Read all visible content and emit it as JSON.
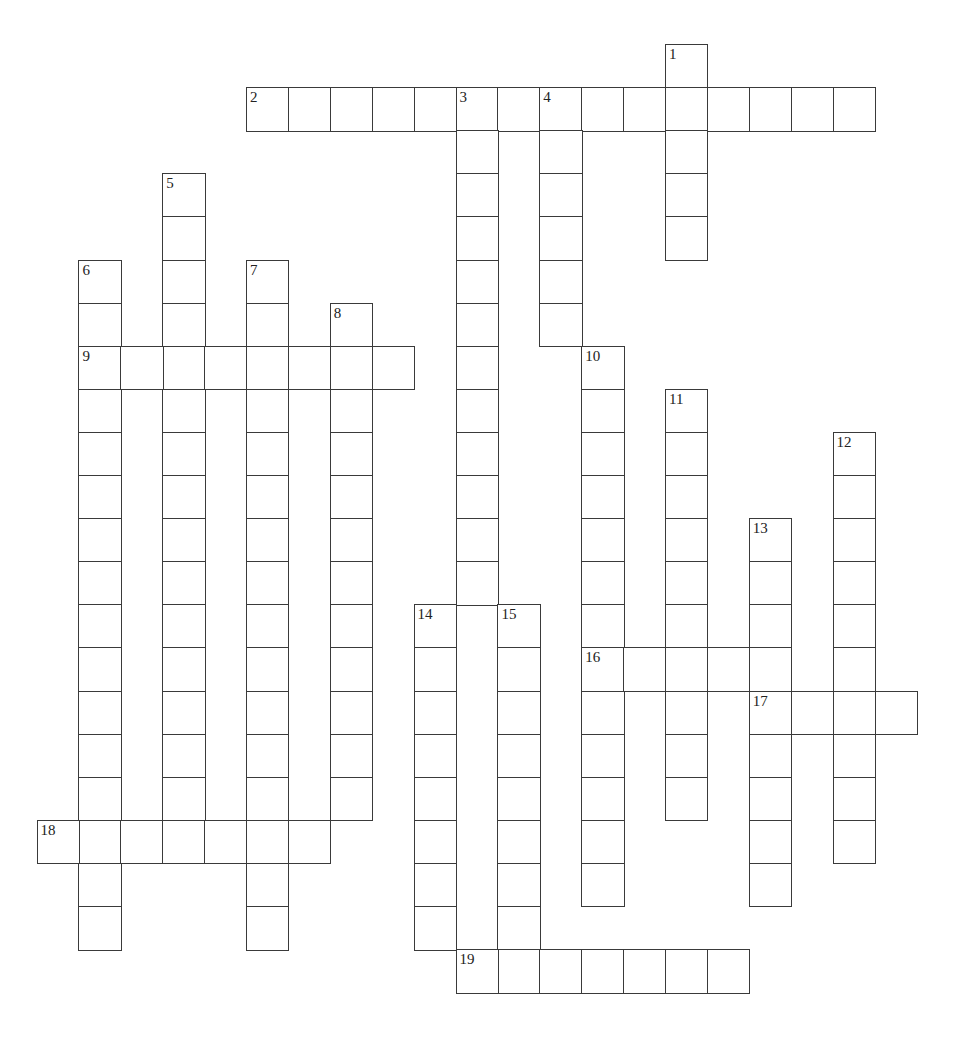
{
  "puzzle": {
    "type": "crossword",
    "grid": {
      "origin_x": 36.5,
      "origin_y": 44,
      "cell_width": 41.9,
      "cell_height": 43.1,
      "line_color": "#3a3a3a",
      "background": "#ffffff"
    },
    "entries": [
      {
        "number": "1",
        "direction": "down",
        "col": 15,
        "row": 0,
        "length": 5
      },
      {
        "number": "2",
        "direction": "across",
        "col": 5,
        "row": 1,
        "length": 15
      },
      {
        "number": "3",
        "direction": "down",
        "col": 10,
        "row": 1,
        "length": 12
      },
      {
        "number": "4",
        "direction": "down",
        "col": 12,
        "row": 1,
        "length": 6
      },
      {
        "number": "5",
        "direction": "down",
        "col": 3,
        "row": 3,
        "length": 15
      },
      {
        "number": "6",
        "direction": "down",
        "col": 1,
        "row": 5,
        "length": 16
      },
      {
        "number": "7",
        "direction": "down",
        "col": 5,
        "row": 5,
        "length": 16
      },
      {
        "number": "8",
        "direction": "down",
        "col": 7,
        "row": 6,
        "length": 12
      },
      {
        "number": "9",
        "direction": "across",
        "col": 1,
        "row": 7,
        "length": 8
      },
      {
        "number": "10",
        "direction": "down",
        "col": 13,
        "row": 7,
        "length": 13
      },
      {
        "number": "11",
        "direction": "down",
        "col": 15,
        "row": 8,
        "length": 10
      },
      {
        "number": "12",
        "direction": "down",
        "col": 19,
        "row": 9,
        "length": 10
      },
      {
        "number": "13",
        "direction": "down",
        "col": 17,
        "row": 11,
        "length": 9
      },
      {
        "number": "14",
        "direction": "down",
        "col": 9,
        "row": 13,
        "length": 8
      },
      {
        "number": "15",
        "direction": "down",
        "col": 11,
        "row": 13,
        "length": 9
      },
      {
        "number": "16",
        "direction": "across",
        "col": 13,
        "row": 14,
        "length": 5
      },
      {
        "number": "17",
        "direction": "across",
        "col": 17,
        "row": 15,
        "length": 4
      },
      {
        "number": "18",
        "direction": "across",
        "col": 0,
        "row": 18,
        "length": 7
      },
      {
        "number": "19",
        "direction": "across",
        "col": 10,
        "row": 21,
        "length": 7
      }
    ]
  }
}
